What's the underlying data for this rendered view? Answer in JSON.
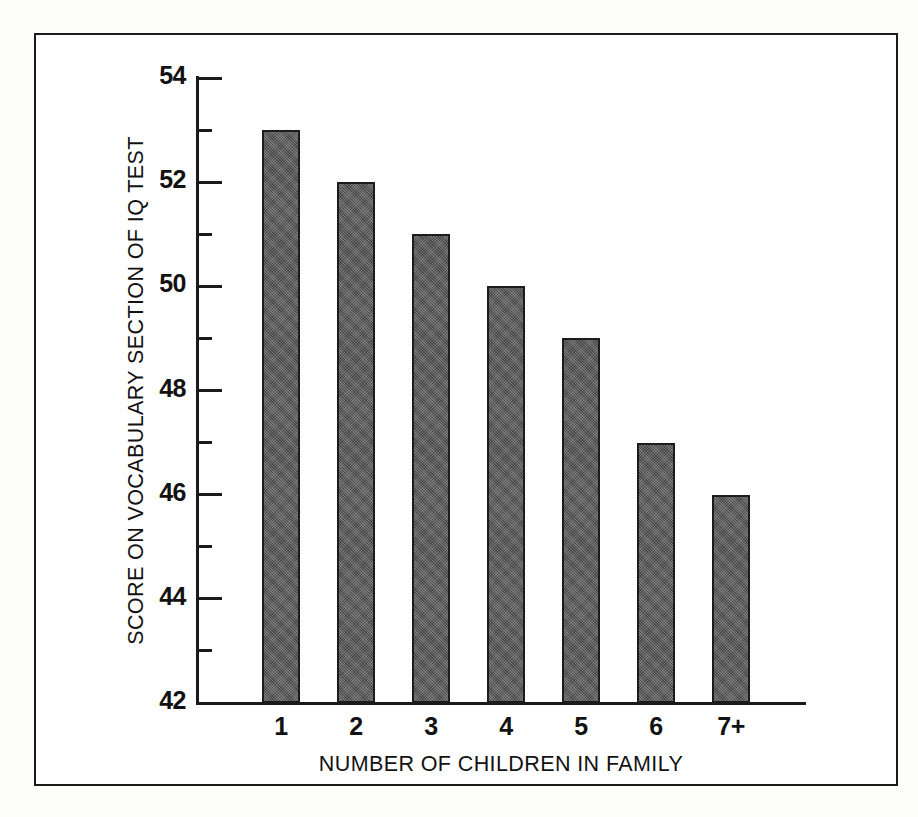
{
  "chart_data": {
    "type": "bar",
    "title": "",
    "subtitle": "",
    "xlabel": "NUMBER OF CHILDREN IN FAMILY",
    "ylabel": "SCORE ON VOCABULARY SECTION OF IQ TEST",
    "categories": [
      "1",
      "2",
      "3",
      "4",
      "5",
      "6",
      "7+"
    ],
    "values": [
      53,
      52,
      51,
      50,
      49,
      47,
      46
    ],
    "ylim": [
      42,
      54
    ],
    "y_major_ticks": [
      42,
      44,
      46,
      48,
      50,
      52,
      54
    ],
    "y_major_tick_labels": [
      "42",
      "44",
      "46",
      "48",
      "50",
      "52",
      "54"
    ],
    "y_minor_ticks": [
      43,
      45,
      47,
      49,
      51,
      53
    ],
    "grid": false,
    "legend": false,
    "legend_position": "none",
    "bar_color": "#565656",
    "bar_edge_color": "#1c1c1c",
    "axis_color": "#1b1b1b",
    "background_color": "#ffffff",
    "frame_color": "#1a1a1a"
  }
}
